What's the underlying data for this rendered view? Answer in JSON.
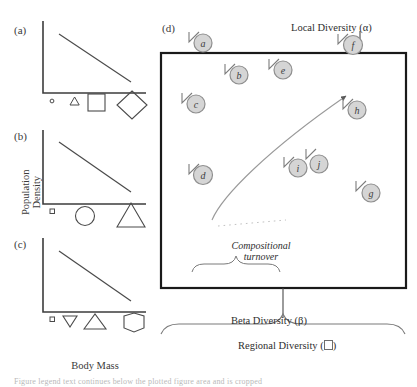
{
  "figure": {
    "panels": [
      {
        "id": "a",
        "label": "(a)",
        "trend": "decreasing",
        "shape_series": [
          "circle-tiny",
          "triangle-small",
          "square-medium",
          "diamond-large"
        ]
      },
      {
        "id": "b",
        "label": "(b)",
        "trend": "decreasing",
        "shape_series": [
          "square-tiny",
          "circle-medium",
          "triangle-large"
        ]
      },
      {
        "id": "c",
        "label": "(c)",
        "trend": "decreasing",
        "shape_series": [
          "square-tiny",
          "triangle-down-small",
          "triangle-up-medium",
          "hexagon-large"
        ]
      },
      {
        "id": "d",
        "label": "(d)"
      }
    ],
    "axes": {
      "y_label_line1": "Population",
      "y_label_line2": "Density",
      "x_label": "Body Mass"
    },
    "region": {
      "communities": [
        {
          "id": "a",
          "letter": "a",
          "x": 53,
          "y": 43
        },
        {
          "id": "b",
          "letter": "b",
          "x": 89,
          "y": 75
        },
        {
          "id": "c",
          "letter": "c",
          "x": 46,
          "y": 104
        },
        {
          "id": "e",
          "letter": "e",
          "x": 133,
          "y": 70
        },
        {
          "id": "f",
          "letter": "f",
          "x": 203,
          "y": 45
        },
        {
          "id": "h",
          "letter": "h",
          "x": 207,
          "y": 110
        },
        {
          "id": "d",
          "letter": "d",
          "x": 53,
          "y": 175
        },
        {
          "id": "i",
          "letter": "i",
          "x": 148,
          "y": 168
        },
        {
          "id": "j",
          "letter": "j",
          "x": 169,
          "y": 164
        },
        {
          "id": "g",
          "letter": "g",
          "x": 221,
          "y": 193
        }
      ],
      "annotations": {
        "local_diversity": "Local Diversity (α)",
        "beta_diversity": "Beta Diversity (β)",
        "regional_diversity_prefix": "Regional Diversity (",
        "regional_diversity_suffix": ")",
        "compositional_turnover_line1": "Compositional",
        "compositional_turnover_line2": "turnover"
      }
    },
    "colors": {
      "circle_fill": "#d5d5d5",
      "circle_stroke": "#8f8f8f",
      "axis_line": "#3c3c3c",
      "trend_line": "#4a4a4a",
      "box_border": "#1a1a1a",
      "shape_stroke": "#4a4a4a",
      "arc": "#9a9a9a",
      "brace": "#7a7a7a",
      "text": "#2e2e2e"
    },
    "caption_partial": "Figure legend text continues below the plotted figure area and is cropped"
  }
}
